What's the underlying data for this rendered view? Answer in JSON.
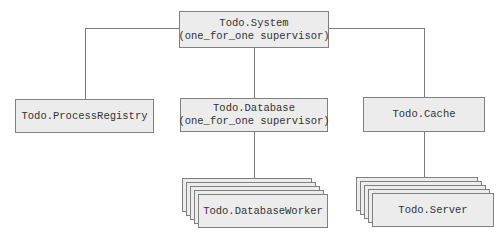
{
  "diagram": {
    "type": "supervision-tree",
    "nodes": {
      "root": {
        "title": "Todo.System",
        "subtitle": "(one_for_one supervisor)"
      },
      "registry": {
        "title": "Todo.ProcessRegistry"
      },
      "database": {
        "title": "Todo.Database",
        "subtitle": "(one_for_one supervisor)"
      },
      "cache": {
        "title": "Todo.Cache"
      },
      "worker": {
        "title": "Todo.DatabaseWorker",
        "multiple": true
      },
      "server": {
        "title": "Todo.Server",
        "multiple": true
      }
    },
    "edges": [
      [
        "Todo.System",
        "Todo.ProcessRegistry"
      ],
      [
        "Todo.System",
        "Todo.Database"
      ],
      [
        "Todo.System",
        "Todo.Cache"
      ],
      [
        "Todo.Database",
        "Todo.DatabaseWorker"
      ],
      [
        "Todo.Cache",
        "Todo.Server"
      ]
    ],
    "colors": {
      "box_fill": "#ececec",
      "box_border": "#808080",
      "line": "#7a7a7a"
    }
  }
}
